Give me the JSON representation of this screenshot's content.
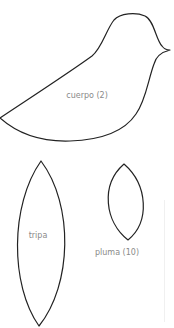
{
  "pattern": {
    "stroke_color": "#222222",
    "label_color": "#8a8a8a",
    "pieces": [
      {
        "id": "cuerpo",
        "label": "cuerpo (2)"
      },
      {
        "id": "tripa",
        "label": "tripa"
      },
      {
        "id": "pluma",
        "label": "pluma (10)"
      }
    ]
  }
}
